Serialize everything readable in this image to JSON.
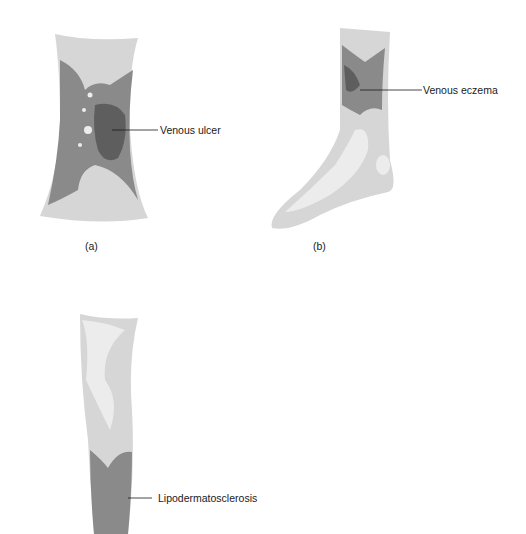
{
  "figure": {
    "panels": [
      {
        "id": "a",
        "caption": "(a)",
        "label": "Venous ulcer"
      },
      {
        "id": "b",
        "caption": "(b)",
        "label": "Venous eczema"
      },
      {
        "id": "c",
        "caption": "",
        "label": "Lipodermatosclerosis"
      }
    ]
  },
  "colors": {
    "skin_light": "#d6d6d6",
    "skin_pale": "#ececec",
    "affected": "#8a8a8a",
    "ulcer": "#5e5e5e",
    "line": "#1a1a1a"
  }
}
